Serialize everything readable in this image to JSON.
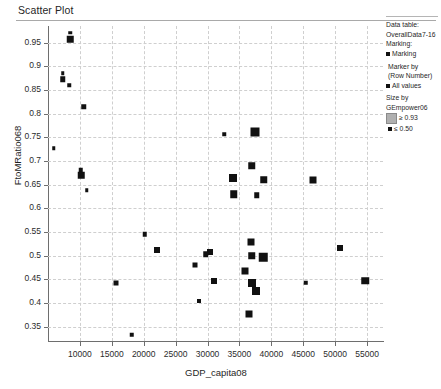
{
  "window": {
    "title": "Scatter Plot"
  },
  "legend": {
    "data_table_label": "Data table:",
    "data_table_value": "OverallData7-16",
    "marking_label": "Marking:",
    "marking_item": "Marking",
    "marker_by_label": "Marker by",
    "marker_by_value": "(Row Number)",
    "marker_by_item": "All values",
    "size_by_label": "Size by",
    "size_by_value": "GEmpower06",
    "size_large_label": "≥ 0.93",
    "size_small_label": "≤ 0.50",
    "marker_color": "#111111",
    "size_large_swatch_color": "#b0b0b0"
  },
  "chart_data": {
    "type": "scatter",
    "title": "Scatter Plot",
    "xlabel": "GDP_capita08",
    "ylabel": "FtoMRatio068",
    "xlim": [
      5000,
      57500
    ],
    "ylim": [
      0.32,
      0.985
    ],
    "grid": true,
    "legend_position": "right",
    "xticks": [
      10000,
      15000,
      20000,
      25000,
      30000,
      35000,
      40000,
      45000,
      50000,
      55000
    ],
    "yticks": [
      0.35,
      0.4,
      0.45,
      0.5,
      0.55,
      0.6,
      0.65,
      0.7,
      0.75,
      0.8,
      0.85,
      0.9,
      0.95
    ],
    "size_encoding": {
      "field": "GEmpower06",
      "large_value": 0.93,
      "small_value": 0.5
    },
    "points": [
      {
        "x": 8450,
        "y": 0.971,
        "s": 3.5
      },
      {
        "x": 8450,
        "y": 0.957,
        "s": 6.5
      },
      {
        "x": 7300,
        "y": 0.885,
        "s": 3.5
      },
      {
        "x": 7300,
        "y": 0.873,
        "s": 5.5
      },
      {
        "x": 8300,
        "y": 0.86,
        "s": 3.5
      },
      {
        "x": 10600,
        "y": 0.815,
        "s": 5.5
      },
      {
        "x": 5900,
        "y": 0.727,
        "s": 3.5
      },
      {
        "x": 10100,
        "y": 0.681,
        "s": 4.5
      },
      {
        "x": 10200,
        "y": 0.67,
        "s": 6.5
      },
      {
        "x": 11100,
        "y": 0.638,
        "s": 3.5
      },
      {
        "x": 32600,
        "y": 0.757,
        "s": 3.5
      },
      {
        "x": 37400,
        "y": 0.762,
        "s": 9.0
      },
      {
        "x": 36900,
        "y": 0.69,
        "s": 7.5
      },
      {
        "x": 34000,
        "y": 0.665,
        "s": 8.0
      },
      {
        "x": 38800,
        "y": 0.66,
        "s": 7.5
      },
      {
        "x": 46600,
        "y": 0.66,
        "s": 7.0
      },
      {
        "x": 34100,
        "y": 0.63,
        "s": 7.5
      },
      {
        "x": 37700,
        "y": 0.628,
        "s": 5.5
      },
      {
        "x": 20200,
        "y": 0.545,
        "s": 4.5
      },
      {
        "x": 22100,
        "y": 0.513,
        "s": 6.0
      },
      {
        "x": 36800,
        "y": 0.53,
        "s": 7.0
      },
      {
        "x": 36900,
        "y": 0.5,
        "s": 7.5
      },
      {
        "x": 29700,
        "y": 0.503,
        "s": 5.5
      },
      {
        "x": 30400,
        "y": 0.508,
        "s": 6.0
      },
      {
        "x": 38700,
        "y": 0.497,
        "s": 8.5
      },
      {
        "x": 50800,
        "y": 0.517,
        "s": 6.0
      },
      {
        "x": 28000,
        "y": 0.48,
        "s": 5.0
      },
      {
        "x": 35900,
        "y": 0.468,
        "s": 7.0
      },
      {
        "x": 15600,
        "y": 0.443,
        "s": 5.0
      },
      {
        "x": 31000,
        "y": 0.447,
        "s": 6.0
      },
      {
        "x": 36900,
        "y": 0.443,
        "s": 8.0
      },
      {
        "x": 37600,
        "y": 0.425,
        "s": 8.0
      },
      {
        "x": 45400,
        "y": 0.443,
        "s": 4.5
      },
      {
        "x": 54700,
        "y": 0.447,
        "s": 7.5
      },
      {
        "x": 28700,
        "y": 0.405,
        "s": 4.0
      },
      {
        "x": 36500,
        "y": 0.378,
        "s": 7.0
      },
      {
        "x": 18100,
        "y": 0.333,
        "s": 4.5
      }
    ]
  }
}
